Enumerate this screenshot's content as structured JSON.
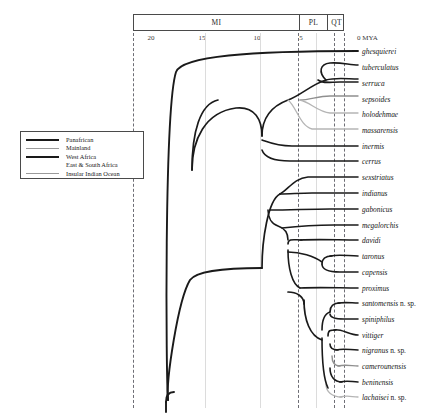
{
  "axis": {
    "unit_label": "0 MYA",
    "epochs": [
      {
        "label": "MI",
        "start_mya": 23.0,
        "end_mya": 5.3
      },
      {
        "label": "PL",
        "start_mya": 5.3,
        "end_mya": 2.6
      },
      {
        "label": "QT",
        "start_mya": 2.6,
        "end_mya": 0.0
      }
    ],
    "ticks": [
      {
        "label": "20",
        "mya": 20
      },
      {
        "label": "15",
        "mya": 15
      },
      {
        "label": "10",
        "mya": 10
      },
      {
        "label": "5",
        "mya": 5
      },
      {
        "label": "",
        "mya": 0
      }
    ],
    "dashed_gridlines_mya": [
      22.6,
      5,
      2.6,
      0
    ],
    "solid_gridlines_mya": [
      15,
      10,
      3.9
    ]
  },
  "legend": {
    "items": [
      {
        "label": "Panafrican",
        "color": "#1a1a1a",
        "width": 2.2
      },
      {
        "label": "Mainland",
        "color": "#9a9a9a",
        "width": 1.4
      },
      {
        "label": "West Africa",
        "color": "#1a1a1a",
        "width": 2.2
      },
      {
        "label": "East & South Africa",
        "color": "#ffffff",
        "width": 1.2
      },
      {
        "label": "Insular Indian Ocean",
        "color": "#9a9a9a",
        "width": 1.4
      }
    ]
  },
  "colors": {
    "black": "#1a1a1a",
    "gray": "#8f8f8f",
    "light_gray": "#b5b5b5",
    "frame": "#4a4a4a",
    "grid_solid": "#dcdcdc",
    "grid_dashed": "#55555e"
  },
  "taxa": [
    {
      "name": "ghesquierei",
      "y": 51,
      "nsp": false
    },
    {
      "name": "tuberculatus",
      "y": 67,
      "nsp": false
    },
    {
      "name": "serruca",
      "y": 83,
      "nsp": false
    },
    {
      "name": "sepsoides",
      "y": 99,
      "nsp": false
    },
    {
      "name": "holodehmae",
      "y": 114,
      "nsp": false
    },
    {
      "name": "massarensis",
      "y": 130,
      "nsp": false
    },
    {
      "name": "inermis",
      "y": 146,
      "nsp": false
    },
    {
      "name": "cerrus",
      "y": 161,
      "nsp": false
    },
    {
      "name": "sexstriatus",
      "y": 177,
      "nsp": false
    },
    {
      "name": "indianus",
      "y": 193,
      "nsp": false
    },
    {
      "name": "gabonicus",
      "y": 209,
      "nsp": false
    },
    {
      "name": "megalorchis",
      "y": 225,
      "nsp": false
    },
    {
      "name": "davidi",
      "y": 240,
      "nsp": false
    },
    {
      "name": "taronus",
      "y": 256,
      "nsp": false
    },
    {
      "name": "capensis",
      "y": 272,
      "nsp": false
    },
    {
      "name": "proximus",
      "y": 288,
      "nsp": false
    },
    {
      "name": "santomensis",
      "y": 303,
      "nsp": true
    },
    {
      "name": "spiniphilus",
      "y": 319,
      "nsp": false
    },
    {
      "name": "vittiger",
      "y": 335,
      "nsp": false
    },
    {
      "name": "nigranus",
      "y": 350,
      "nsp": true
    },
    {
      "name": "camerounensis",
      "y": 366,
      "nsp": false
    },
    {
      "name": "beninensis",
      "y": 382,
      "nsp": false
    },
    {
      "name": "lachaisei",
      "y": 397,
      "nsp": true
    }
  ],
  "nsp_suffix": " n. sp.",
  "tree_branches": [
    {
      "id": "root-stem",
      "color": "#1a1a1a",
      "width": 2.0,
      "d": "M 166 400 L 166 395"
    },
    {
      "id": "root-split",
      "color": "#1a1a1a",
      "width": 2.0,
      "d": "M 166 400 C 166 370 166 110 180 72 C 186 55 300 51 358 51"
    },
    {
      "id": "root-lower",
      "color": "#1a1a1a",
      "width": 2.0,
      "d": "M 166 400 C 166 370 180 300 192 270 C 198 258 230 256 262 256"
    },
    {
      "id": "clade-a-stem",
      "color": "#1a1a1a",
      "width": 1.8,
      "d": "M 192 150 C 192 130 205 112 240 105"
    },
    {
      "id": "clade-a-upper",
      "color": "#1a1a1a",
      "width": 1.8,
      "d": "M 262 165 C 262 140 275 105 300 99"
    },
    {
      "id": "clade-b",
      "color": "#8f8f8f",
      "width": 1.5,
      "d": "M 300 99 C 312 97 330 83 340 83"
    },
    {
      "id": "clade-c",
      "color": "#8f8f8f",
      "width": 1.5,
      "d": "M 300 99 C 312 101 325 114 340 114"
    }
  ]
}
